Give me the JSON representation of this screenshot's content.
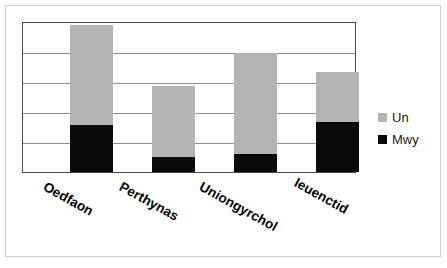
{
  "chart_data": {
    "type": "bar",
    "subtype": "stacked-bar",
    "title": "",
    "xlabel": "",
    "ylabel": "",
    "categories": [
      "Oedfaon",
      "Perthynas",
      "Uniongyrchol",
      "Ieuenctid"
    ],
    "series": [
      {
        "name": "Mwy",
        "color": "#0a0a0a",
        "values": [
          32,
          10,
          12,
          34
        ]
      },
      {
        "name": "Un",
        "color": "#b3b3b3",
        "values": [
          67,
          48,
          68,
          33
        ]
      }
    ],
    "totals": [
      99,
      58,
      80,
      67
    ],
    "ylim": [
      0,
      100
    ],
    "yticks": [
      0,
      20,
      40,
      60,
      80,
      100
    ],
    "ytick_labels": [],
    "grid": true,
    "grid_axis": "y",
    "gridline_count": 4,
    "legend": {
      "position": "right",
      "entries": [
        {
          "label": "Un",
          "color": "#b3b3b3"
        },
        {
          "label": "Mwy",
          "color": "#0a0a0a"
        }
      ]
    },
    "xtick_rotation": -29,
    "plot_background": "#ffffff",
    "frame_color": "#4a4a4a"
  },
  "figure": {
    "background": "#ffffff",
    "border_color": "#cfcfcf"
  },
  "bars": [
    {
      "category": "Oedfaon",
      "total_pct": 98.7,
      "mwy_pct": 31.8,
      "un_pct": 66.9
    },
    {
      "category": "Perthynas",
      "total_pct": 57.6,
      "mwy_pct": 9.9,
      "un_pct": 47.7
    },
    {
      "category": "Uniongyrchol",
      "total_pct": 80.1,
      "mwy_pct": 11.9,
      "un_pct": 68.2
    },
    {
      "category": "Ieuenctid",
      "total_pct": 66.9,
      "mwy_pct": 33.8,
      "un_pct": 33.1
    }
  ],
  "legend": {
    "un_label": "Un",
    "mwy_label": "Mwy"
  },
  "xaxis": {
    "labels": [
      "Oedfaon",
      "Perthynas",
      "Uniongyrchol",
      "Ieuenctid"
    ]
  }
}
